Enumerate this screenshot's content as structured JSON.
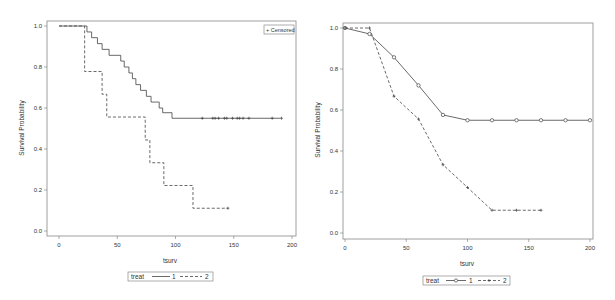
{
  "chart_data": [
    {
      "type": "line",
      "subtype": "step (Kaplan-Meier)",
      "title": "",
      "xlabel": "tsurv",
      "ylabel": "Survival Probability",
      "xlim": [
        0,
        200
      ],
      "ylim": [
        0,
        1.0
      ],
      "x_ticks": [
        "0",
        "50",
        "100",
        "150",
        "200"
      ],
      "y_ticks": [
        "0.0",
        "0.2",
        "0.4",
        "0.6",
        "0.8",
        "1.0"
      ],
      "grid": false,
      "legend_title": "treat",
      "legend_position": "bottom",
      "inset_legend": "+ Censored",
      "series": [
        {
          "name": "1",
          "style": "solid",
          "x": [
            0,
            22,
            24,
            28,
            33,
            37,
            43,
            53,
            56,
            60,
            63,
            66,
            70,
            75,
            79,
            86,
            89,
            97,
            190
          ],
          "y": [
            1.0,
            1.0,
            0.971,
            0.943,
            0.914,
            0.886,
            0.857,
            0.829,
            0.8,
            0.771,
            0.743,
            0.714,
            0.686,
            0.657,
            0.629,
            0.6,
            0.577,
            0.55,
            0.55
          ],
          "censored_x": [
            123,
            132,
            134,
            137,
            142,
            144,
            149,
            153,
            155,
            158,
            163,
            183,
            191
          ]
        },
        {
          "name": "2",
          "style": "dashed",
          "x": [
            0,
            22,
            37,
            41,
            74,
            78,
            90,
            115,
            145
          ],
          "y": [
            1.0,
            0.778,
            0.667,
            0.556,
            0.444,
            0.333,
            0.222,
            0.111,
            0.111
          ],
          "censored_x": [
            145
          ]
        }
      ]
    },
    {
      "type": "line",
      "title": "",
      "xlabel": "tsurv",
      "ylabel": "Survival Probability",
      "xlim": [
        0,
        200
      ],
      "ylim": [
        0,
        1.0
      ],
      "x_ticks": [
        "0",
        "50",
        "100",
        "150",
        "200"
      ],
      "y_ticks": [
        "0.0",
        "0.2",
        "0.4",
        "0.6",
        "0.8",
        "1.0"
      ],
      "grid": false,
      "legend_title": "treat",
      "legend_position": "bottom",
      "series": [
        {
          "name": "1",
          "style": "solid",
          "marker": "circle",
          "x": [
            0,
            20,
            40,
            60,
            80,
            100,
            120,
            140,
            160,
            180,
            200
          ],
          "y": [
            1.0,
            0.971,
            0.857,
            0.72,
            0.576,
            0.55,
            0.55,
            0.55,
            0.55,
            0.55,
            0.55
          ]
        },
        {
          "name": "2",
          "style": "dashed",
          "marker": "plus",
          "x": [
            0,
            20,
            40,
            60,
            80,
            100,
            120,
            140,
            160
          ],
          "y": [
            1.0,
            1.0,
            0.667,
            0.556,
            0.333,
            0.222,
            0.111,
            0.111,
            0.111
          ]
        }
      ]
    }
  ],
  "labels": {
    "left": {
      "ylabel": "Survival Probability",
      "xlabel": "tsurv",
      "legend_title": "treat",
      "legend_s1": "1",
      "legend_s2": "2",
      "censored": "+ Censored"
    },
    "right": {
      "ylabel": "Survival Probability",
      "xlabel": "tsurv",
      "legend_title": "treat",
      "legend_s1": "1",
      "legend_s2": "2"
    }
  },
  "colors": {
    "line": "#444444",
    "frame": "#777777",
    "text": "#333333"
  }
}
